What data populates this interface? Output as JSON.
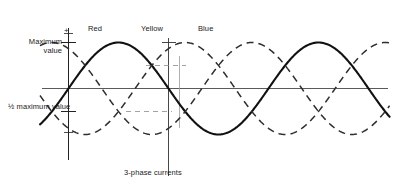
{
  "figure": {
    "caption": "3-phase currents",
    "axis": {
      "maximum_value_label_line1": "Maximum",
      "maximum_value_label_line2": "value",
      "half_maximum_label_line1": "½ maximum",
      "half_maximum_label_line2": "value",
      "positive_sign": "+",
      "negative_sign": "−"
    },
    "curve_labels": {
      "red": "Red",
      "yellow": "Yellow",
      "blue": "Blue"
    },
    "colors": {
      "ink": "#1a1a1a",
      "solid_curve": "#111111",
      "dashed_curve": "#333333",
      "baseline": "#555555",
      "background": "#ffffff"
    }
  },
  "chart_data": {
    "type": "line",
    "title": "3-phase currents",
    "xlabel": "",
    "ylabel": "",
    "ylim": [
      -1,
      1
    ],
    "xlim": [
      0,
      810
    ],
    "grid": false,
    "legend_position": "above-curves",
    "y_ticks": [
      {
        "value": 1.0,
        "label": "Maximum value"
      },
      {
        "value": 0.5,
        "label": "½ maximum value"
      },
      {
        "value": 1.15,
        "label": "+"
      },
      {
        "value": -1.0,
        "label": "−"
      }
    ],
    "x_degrees": [
      0,
      15,
      30,
      45,
      60,
      75,
      90,
      105,
      120,
      135,
      150,
      165,
      180,
      195,
      210,
      225,
      240,
      255,
      270,
      285,
      300,
      315,
      330,
      345,
      360,
      375,
      390,
      405,
      420,
      435,
      450,
      465,
      480,
      495,
      510,
      525,
      540,
      555,
      570,
      585,
      600,
      615,
      630,
      645,
      660,
      675,
      690,
      705,
      720,
      735,
      750,
      765,
      780,
      795,
      810
    ],
    "series": [
      {
        "name": "Red",
        "style": "solid",
        "phase_degrees": 0,
        "amplitude": 1.0,
        "values": [
          0,
          0.259,
          0.5,
          0.707,
          0.866,
          0.966,
          1,
          0.966,
          0.866,
          0.707,
          0.5,
          0.259,
          0,
          -0.259,
          -0.5,
          -0.707,
          -0.866,
          -0.966,
          -1,
          -0.966,
          -0.866,
          -0.707,
          -0.5,
          -0.259,
          0,
          0.259,
          0.5,
          0.707,
          0.866,
          0.966,
          1,
          0.966,
          0.866,
          0.707,
          0.5,
          0.259,
          0,
          -0.259,
          -0.5,
          -0.707,
          -0.866,
          -0.966,
          -1,
          -0.966,
          -0.866,
          -0.707,
          -0.5,
          -0.259,
          0,
          0.259,
          0.5,
          0.707,
          0.866,
          0.966,
          1
        ]
      },
      {
        "name": "Yellow",
        "style": "dashed",
        "phase_degrees": -120,
        "amplitude": 1.0,
        "values": [
          -0.866,
          -0.966,
          -1,
          -0.966,
          -0.866,
          -0.707,
          -0.5,
          -0.259,
          0,
          0.259,
          0.5,
          0.707,
          0.866,
          0.966,
          1,
          0.966,
          0.866,
          0.707,
          0.5,
          0.259,
          0,
          -0.259,
          -0.5,
          -0.707,
          -0.866,
          -0.966,
          -1,
          -0.966,
          -0.866,
          -0.707,
          -0.5,
          -0.259,
          0,
          0.259,
          0.5,
          0.707,
          0.866,
          0.966,
          1,
          0.966,
          0.866,
          0.707,
          0.5,
          0.259,
          0,
          -0.259,
          -0.5,
          -0.707,
          -0.866,
          -0.966,
          -1,
          -0.966,
          -0.866,
          -0.707,
          -0.5
        ]
      },
      {
        "name": "Blue",
        "style": "dashed",
        "phase_degrees": -240,
        "amplitude": 1.0,
        "values": [
          0.866,
          0.707,
          0.5,
          0.259,
          0,
          -0.259,
          -0.5,
          -0.707,
          -0.866,
          -0.966,
          -1,
          -0.966,
          -0.866,
          -0.707,
          -0.5,
          -0.259,
          0,
          0.259,
          0.5,
          0.707,
          0.866,
          0.966,
          1,
          0.966,
          0.866,
          0.707,
          0.5,
          0.259,
          0,
          -0.259,
          -0.5,
          -0.707,
          -0.866,
          -0.966,
          -1,
          -0.966,
          -0.866,
          -0.707,
          -0.5,
          -0.259,
          0,
          0.259,
          0.5,
          0.707,
          0.866,
          0.966,
          1,
          0.966,
          0.866,
          0.707,
          0.5,
          0.259,
          0,
          -0.259,
          -0.5
        ]
      }
    ],
    "annotations": [
      {
        "text": "Red",
        "x_degrees": 90,
        "y": 1.18
      },
      {
        "text": "Yellow",
        "x_degrees": 210,
        "y": 1.18
      },
      {
        "text": "Blue",
        "x_degrees": 330,
        "y": 1.18
      },
      {
        "text": "3-phase currents",
        "x_degrees": 240,
        "y": -1.85
      }
    ],
    "reference_lines": [
      {
        "type": "vertical",
        "x_degrees": 0,
        "description": "y-axis"
      },
      {
        "type": "vertical",
        "x_degrees": 210,
        "description": "yellow-peak marker"
      },
      {
        "type": "horizontal",
        "y": 0,
        "description": "zero baseline"
      }
    ]
  }
}
